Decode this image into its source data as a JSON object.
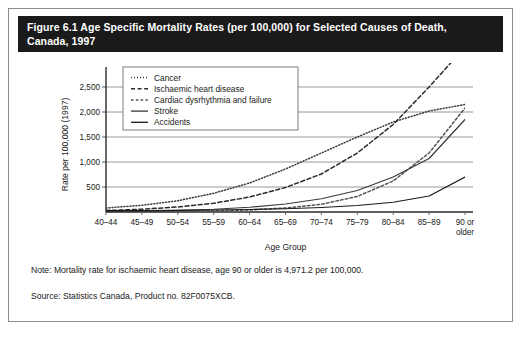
{
  "figure": {
    "title": "Figure 6.1 Age Specific Mortality Rates (per 100,000) for Selected Causes of Death, Canada, 1997",
    "title_line1": "Figure 6.1 Age Specific Mortality Rates (per 100,000) for Selected Causes of Death,",
    "title_line2": "Canada, 1997",
    "note": "Note: Mortality rate for ischaemic heart disease, age 90 or older is 4,971.2 per 100,000.",
    "source": "Source: Statistics Canada, Product no. 82F0075XCB.",
    "title_bg": "#1a1a1a",
    "title_fg": "#ffffff"
  },
  "chart_data": {
    "type": "line",
    "title": "Age Specific Mortality Rates (per 100,000) for Selected Causes of Death, Canada, 1997",
    "xlabel": "Age Group",
    "ylabel": "Rate per 100,000 (1997)",
    "categories": [
      "40–44",
      "45–49",
      "50–54",
      "55–59",
      "60–64",
      "65–69",
      "70–74",
      "75–79",
      "80–84",
      "85–89",
      "90 or older"
    ],
    "category_labels_multiline": [
      [
        "40–44"
      ],
      [
        "45–49"
      ],
      [
        "50–54"
      ],
      [
        "55–59"
      ],
      [
        "60–64"
      ],
      [
        "65–69"
      ],
      [
        "70–74"
      ],
      [
        "75–79"
      ],
      [
        "80–84"
      ],
      [
        "85–89"
      ],
      [
        "90 or",
        "older"
      ]
    ],
    "ylim": [
      0,
      2700
    ],
    "yticks": [
      500,
      1000,
      1500,
      2000,
      2500
    ],
    "ytick_labels": [
      "500",
      "1,000",
      "1,500",
      "2,000",
      "2,500"
    ],
    "grid": "horizontal",
    "legend_position": "top-left-inside",
    "series": [
      {
        "name": "Cancer",
        "style": "dotted",
        "color": "#3a3a3a",
        "values": [
          80,
          135,
          225,
          375,
          580,
          860,
          1180,
          1500,
          1800,
          2020,
          2150
        ]
      },
      {
        "name": "Ischaemic heart disease",
        "style": "dashed",
        "color": "#2a2a2a",
        "values": [
          30,
          55,
          100,
          175,
          300,
          490,
          760,
          1180,
          1750,
          2500,
          4971.2
        ]
      },
      {
        "name": "Cardiac dysrhythmia and failure",
        "style": "dash-dot",
        "color": "#555555",
        "values": [
          4,
          7,
          12,
          22,
          42,
          80,
          155,
          310,
          620,
          1180,
          2080
        ]
      },
      {
        "name": "Stroke",
        "style": "solid",
        "color": "#3a3a3a",
        "values": [
          14,
          20,
          32,
          55,
          95,
          160,
          265,
          430,
          700,
          1070,
          1850
        ]
      },
      {
        "name": "Accidents",
        "style": "solid",
        "color": "#1a1a1a",
        "values": [
          28,
          30,
          34,
          40,
          50,
          65,
          90,
          130,
          195,
          320,
          700
        ]
      }
    ]
  }
}
